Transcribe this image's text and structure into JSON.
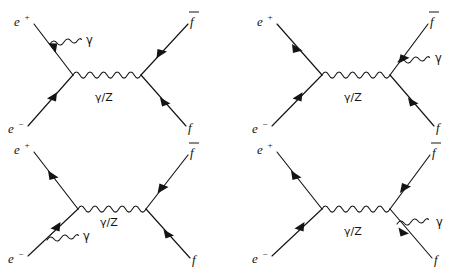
{
  "figure": {
    "background_color": "#ffffff",
    "line_color": "#141414",
    "columns": 2,
    "rows": 2,
    "diagram_count": 4
  },
  "labels": {
    "positron": "e",
    "positron_sup": "+",
    "electron": "e",
    "electron_sup": "−",
    "fermion": "f",
    "antifermion": "f",
    "photon": "γ",
    "propagator": "γ/Z"
  },
  "diagrams": [
    {
      "id": "diagram-1",
      "position": "top-left",
      "radiation_leg": "incoming-positron",
      "description": "Initial state radiation from the incoming positron line",
      "legs": [
        {
          "name": "incoming-positron",
          "label": "e+",
          "corner": "top-left"
        },
        {
          "name": "incoming-electron",
          "label": "e-",
          "corner": "bottom-left"
        },
        {
          "name": "outgoing-antifermion",
          "label": "f-bar",
          "corner": "top-right"
        },
        {
          "name": "outgoing-fermion",
          "label": "f",
          "corner": "bottom-right"
        }
      ],
      "propagator_label": "γ/Z",
      "photon_label": "γ"
    },
    {
      "id": "diagram-2",
      "position": "top-right",
      "radiation_leg": "outgoing-antifermion",
      "description": "Final state radiation from the outgoing antifermion line",
      "legs": [
        {
          "name": "incoming-positron",
          "label": "e+",
          "corner": "top-left"
        },
        {
          "name": "incoming-electron",
          "label": "e-",
          "corner": "bottom-left"
        },
        {
          "name": "outgoing-antifermion",
          "label": "f-bar",
          "corner": "top-right"
        },
        {
          "name": "outgoing-fermion",
          "label": "f",
          "corner": "bottom-right"
        }
      ],
      "propagator_label": "γ/Z",
      "photon_label": "γ"
    },
    {
      "id": "diagram-3",
      "position": "bottom-left",
      "radiation_leg": "incoming-electron",
      "description": "Initial state radiation from the incoming electron line",
      "legs": [
        {
          "name": "incoming-positron",
          "label": "e+",
          "corner": "top-left"
        },
        {
          "name": "incoming-electron",
          "label": "e-",
          "corner": "bottom-left"
        },
        {
          "name": "outgoing-antifermion",
          "label": "f-bar",
          "corner": "top-right"
        },
        {
          "name": "outgoing-fermion",
          "label": "f",
          "corner": "bottom-right"
        }
      ],
      "propagator_label": "γ/Z",
      "photon_label": "γ"
    },
    {
      "id": "diagram-4",
      "position": "bottom-right",
      "radiation_leg": "outgoing-fermion",
      "description": "Final state radiation from the outgoing fermion line",
      "legs": [
        {
          "name": "incoming-positron",
          "label": "e+",
          "corner": "top-left"
        },
        {
          "name": "incoming-electron",
          "label": "e-",
          "corner": "bottom-left"
        },
        {
          "name": "outgoing-antifermion",
          "label": "f-bar",
          "corner": "top-right"
        },
        {
          "name": "outgoing-fermion",
          "label": "f",
          "corner": "bottom-right"
        }
      ],
      "propagator_label": "γ/Z",
      "photon_label": "γ"
    }
  ]
}
